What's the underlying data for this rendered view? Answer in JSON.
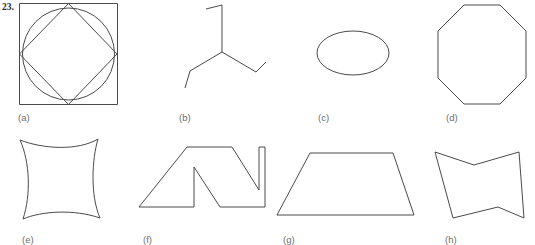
{
  "page": {
    "problem_number": "23.",
    "background_color": "#ffffff",
    "stroke_color": "#4a4a4a",
    "label_color": "#6d6d6d",
    "width": 535,
    "height": 245
  },
  "figures": [
    {
      "key": "a",
      "label": "(a)",
      "label_x": 18,
      "label_y": 112,
      "description": "square with inscribed circle and inscribed diamond joining side midpoints",
      "box": {
        "x": 19,
        "y": 3,
        "width": 99,
        "height": 102
      },
      "shapes": [
        {
          "type": "rect",
          "x": 0.5,
          "y": 0.5,
          "width": 98,
          "height": 101
        },
        {
          "type": "circle",
          "cx": 49.5,
          "cy": 51,
          "r": 46
        },
        {
          "type": "polygon",
          "points": "49.5,0.5 98,51 49.5,101.5 0.5,51"
        }
      ]
    },
    {
      "key": "b",
      "label": "(b)",
      "label_x": 179,
      "label_y": 112,
      "description": "three-branch Y shape, each branch ending in a short bent segment",
      "box": {
        "x": 183,
        "y": 5,
        "width": 88,
        "height": 86
      },
      "shapes": [
        {
          "type": "polyline",
          "points": "23,4 39,0 39,47"
        },
        {
          "type": "polyline",
          "points": "39,47 7,66 2,83"
        },
        {
          "type": "polyline",
          "points": "39,47 73,67 83,57"
        }
      ]
    },
    {
      "key": "c",
      "label": "(c)",
      "label_x": 318,
      "label_y": 112,
      "description": "horizontal ellipse",
      "box": {
        "x": 316,
        "y": 30,
        "width": 76,
        "height": 48
      },
      "shapes": [
        {
          "type": "ellipse",
          "cx": 37,
          "cy": 23,
          "rx": 36,
          "ry": 22
        }
      ]
    },
    {
      "key": "d",
      "label": "(d)",
      "label_x": 446,
      "label_y": 112,
      "description": "regular octagon",
      "box": {
        "x": 437,
        "y": 4,
        "width": 92,
        "height": 102
      },
      "shapes": [
        {
          "type": "polygon",
          "points": "27,1 63,1 89,27 89,74 63,100 27,100 1,74 1,27"
        }
      ]
    },
    {
      "key": "e",
      "label": "(e)",
      "label_x": 22,
      "label_y": 234,
      "description": "square-ish quadrilateral with four concave (inward curved) sides",
      "box": {
        "x": 18,
        "y": 137,
        "width": 86,
        "height": 86
      },
      "shapes": [
        {
          "type": "path",
          "d": "M 2,3 C 25,12 60,14 80,2 C 74,22 72,58 82,81 C 56,72 24,74 5,82 C 13,58 12,25 2,3 Z"
        }
      ]
    },
    {
      "key": "f",
      "label": "(f)",
      "label_x": 143,
      "label_y": 234,
      "description": "outlined letter-N zigzag block shape",
      "box": {
        "x": 137,
        "y": 144,
        "width": 130,
        "height": 82
      },
      "shapes": [
        {
          "type": "polygon",
          "points": "50,3 95,3 122,46 122,3 128,3 128,63 83,63 57,23 57,63 2,63"
        }
      ]
    },
    {
      "key": "g",
      "label": "(g)",
      "label_x": 283,
      "label_y": 234,
      "description": "isosceles trapezoid, long side down",
      "box": {
        "x": 276,
        "y": 152,
        "width": 139,
        "height": 66
      },
      "shapes": [
        {
          "type": "polygon",
          "points": "34,1 117,1 138,63 1,63"
        }
      ]
    },
    {
      "key": "h",
      "label": "(h)",
      "label_x": 445,
      "label_y": 234,
      "description": "bowtie-like hexagon with concave top and bottom edges",
      "box": {
        "x": 433,
        "y": 150,
        "width": 93,
        "height": 72
      },
      "shapes": [
        {
          "type": "polygon",
          "points": "2,2 41,15 86,2 91,68 65,57 20,68"
        }
      ]
    }
  ]
}
